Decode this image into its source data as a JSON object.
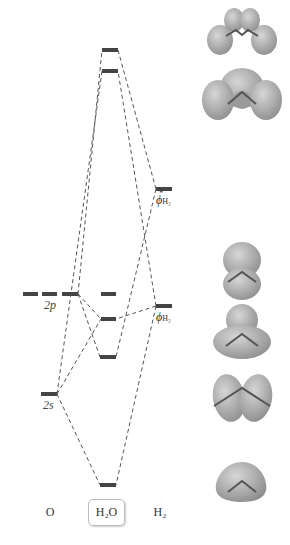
{
  "diagram": {
    "columns": [
      {
        "id": "O",
        "label": "O"
      },
      {
        "id": "H2O",
        "label": "H₂O"
      },
      {
        "id": "H2",
        "label": "H₂"
      }
    ],
    "atomic_labels": {
      "o_2p": "2p",
      "o_2s": "2s",
      "h2_bonding_phi": "ϕ",
      "h2_bonding_sub": "H₂",
      "h2_antibonding_phi": "ϕ",
      "h2_antibonding_sub": "H₂",
      "h2_antibonding_star": "*"
    },
    "levels": {
      "O": [
        {
          "name": "2p",
          "y": 294,
          "degeneracy": 3
        },
        {
          "name": "2s",
          "y": 394,
          "degeneracy": 1
        }
      ],
      "H2O": [
        {
          "name": "MO-6",
          "y": 50
        },
        {
          "name": "MO-5",
          "y": 71
        },
        {
          "name": "MO-4 (nonbonding)",
          "y": 294
        },
        {
          "name": "MO-3",
          "y": 319
        },
        {
          "name": "MO-2",
          "y": 357
        },
        {
          "name": "MO-1",
          "y": 485
        }
      ],
      "H2": [
        {
          "name": "phi*H2",
          "y": 189
        },
        {
          "name": "phiH2",
          "y": 306
        }
      ]
    },
    "orbital_images": [
      "antibonding-orbital-6",
      "antibonding-orbital-5",
      "nonbonding-orbital-4",
      "orbital-3",
      "orbital-2",
      "bonding-orbital-1"
    ],
    "colors": {
      "level": "#444444",
      "connector": "#555555",
      "orbital_fill": "#a8a8a8",
      "orbital_highlight": "#d4d4d4"
    }
  }
}
